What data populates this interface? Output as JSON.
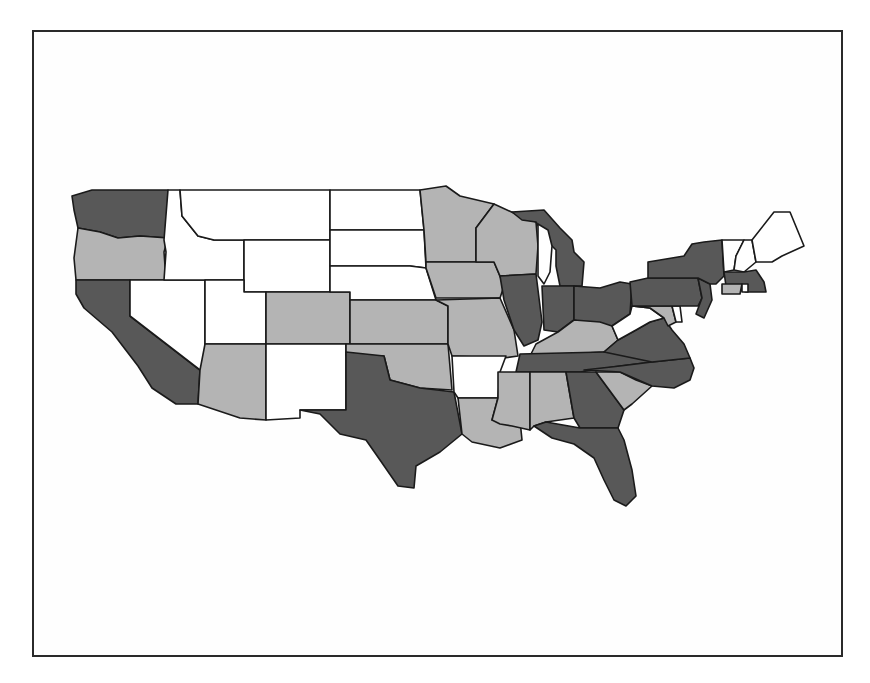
{
  "chart_data": {
    "type": "choropleth",
    "title": "",
    "region": "Contiguous United States",
    "legend": null,
    "classes": {
      "high": {
        "color": "#585858"
      },
      "mid": {
        "color": "#b4b4b4"
      },
      "low": {
        "color": "#ffffff"
      }
    },
    "states": [
      {
        "code": "WA",
        "name": "Washington",
        "class": "high",
        "points": "72,196 92,190 168,190 168,238 140,236 118,238 100,232 78,228 74,210"
      },
      {
        "code": "OR",
        "name": "Oregon",
        "class": "mid",
        "points": "78,228 100,232 118,238 140,236 168,238 164,252 166,280 76,280 74,258"
      },
      {
        "code": "CA",
        "name": "California",
        "class": "high",
        "points": "76,280 130,280 130,316 200,370 198,404 176,404 152,388 138,366 112,332 84,308 76,294"
      },
      {
        "code": "NV",
        "name": "Nevada",
        "class": "low",
        "points": "130,280 205,280 205,362 200,370 130,316"
      },
      {
        "code": "ID",
        "name": "Idaho",
        "class": "low",
        "points": "168,190 180,190 182,216 198,236 214,240 244,240 244,280 164,280 166,252 164,240"
      },
      {
        "code": "MT",
        "name": "Montana",
        "class": "low",
        "points": "180,190 330,190 330,240 244,240 214,240 198,236 182,216"
      },
      {
        "code": "WY",
        "name": "Wyoming",
        "class": "low",
        "points": "244,240 330,240 330,292 244,292"
      },
      {
        "code": "UT",
        "name": "Utah",
        "class": "low",
        "points": "205,280 244,280 244,292 266,292 266,344 205,344"
      },
      {
        "code": "AZ",
        "name": "Arizona",
        "class": "mid",
        "points": "205,344 266,344 266,420 240,418 198,404 200,370"
      },
      {
        "code": "CO",
        "name": "Colorado",
        "class": "mid",
        "points": "266,292 350,292 350,344 266,344"
      },
      {
        "code": "NM",
        "name": "New Mexico",
        "class": "low",
        "points": "266,344 346,344 346,410 300,410 300,418 266,420"
      },
      {
        "code": "ND",
        "name": "North Dakota",
        "class": "low",
        "points": "330,190 420,190 424,230 330,230"
      },
      {
        "code": "SD",
        "name": "South Dakota",
        "class": "low",
        "points": "330,230 424,230 426,268 410,266 330,266"
      },
      {
        "code": "NE",
        "name": "Nebraska",
        "class": "low",
        "points": "330,266 410,266 426,268 436,300 350,300 350,292 330,292"
      },
      {
        "code": "KS",
        "name": "Kansas",
        "class": "mid",
        "points": "350,300 436,300 448,306 448,344 350,344"
      },
      {
        "code": "OK",
        "name": "Oklahoma",
        "class": "mid",
        "points": "346,344 448,344 452,390 420,388 390,380 384,356 346,356"
      },
      {
        "code": "TX",
        "name": "Texas",
        "class": "high",
        "points": "346,352 384,356 390,380 420,388 454,392 462,434 440,452 416,466 414,488 398,486 380,460 366,440 340,434 320,414 300,410 346,410"
      },
      {
        "code": "MN",
        "name": "Minnesota",
        "class": "mid",
        "points": "420,190 446,186 460,196 494,204 476,228 476,262 426,262 424,230"
      },
      {
        "code": "IA",
        "name": "Iowa",
        "class": "mid",
        "points": "426,262 494,262 504,286 500,298 436,298 426,268"
      },
      {
        "code": "MO",
        "name": "Missouri",
        "class": "mid",
        "points": "436,300 500,298 514,330 518,356 504,358 452,356 448,344 448,306"
      },
      {
        "code": "AR",
        "name": "Arkansas",
        "class": "low",
        "points": "452,356 506,356 500,372 498,398 458,398 454,392"
      },
      {
        "code": "LA",
        "name": "Louisiana",
        "class": "mid",
        "points": "458,398 498,398 492,420 520,420 522,440 500,448 472,442 462,434"
      },
      {
        "code": "WI",
        "name": "Wisconsin",
        "class": "mid",
        "points": "476,228 494,204 516,214 536,222 538,246 536,274 500,276 494,262 476,262"
      },
      {
        "code": "IL",
        "name": "Illinois",
        "class": "high",
        "points": "500,276 536,274 542,322 538,340 524,346 514,330 504,300"
      },
      {
        "code": "MI",
        "name": "Michigan",
        "class": "high",
        "points": "512,212 544,210 560,228 572,240 574,252 584,262 582,286 560,286 556,266 556,250 548,242 536,222 522,220"
      },
      {
        "code": "IN",
        "name": "Indiana",
        "class": "high",
        "points": "542,286 574,286 574,320 558,332 544,330"
      },
      {
        "code": "OH",
        "name": "Ohio",
        "class": "high",
        "points": "574,286 600,288 620,282 632,284 630,314 612,326 590,324 574,320"
      },
      {
        "code": "KY",
        "name": "Kentucky",
        "class": "mid",
        "points": "536,344 558,332 574,320 600,322 612,326 618,340 604,352 530,356"
      },
      {
        "code": "TN",
        "name": "Tennessee",
        "class": "high",
        "points": "520,354 604,352 650,350 652,362 620,366 580,372 516,372"
      },
      {
        "code": "MS",
        "name": "Mississippi",
        "class": "mid",
        "points": "498,372 530,372 530,430 512,426 500,424 492,420 498,398"
      },
      {
        "code": "AL",
        "name": "Alabama",
        "class": "mid",
        "points": "530,372 566,372 574,418 546,422 534,426 530,430"
      },
      {
        "code": "GA",
        "name": "Georgia",
        "class": "high",
        "points": "566,372 596,372 624,410 618,428 580,428 574,418"
      },
      {
        "code": "FL",
        "name": "Florida",
        "class": "high",
        "points": "534,426 546,422 580,428 618,428 624,440 632,470 636,496 626,506 614,500 604,480 594,458 574,444 552,438"
      },
      {
        "code": "SC",
        "name": "South Carolina",
        "class": "mid",
        "points": "596,372 620,372 636,380 652,386 632,404 624,410"
      },
      {
        "code": "NC",
        "name": "North Carolina",
        "class": "high",
        "points": "584,370 620,366 652,362 690,358 694,368 690,380 674,388 652,386 620,372"
      },
      {
        "code": "VA",
        "name": "Virginia",
        "class": "high",
        "points": "604,352 618,340 636,330 650,322 664,318 672,330 684,344 690,358 652,362"
      },
      {
        "code": "WV",
        "name": "West Virginia",
        "class": "low",
        "points": "612,326 630,314 632,306 650,308 664,318 650,322 636,330 618,340"
      },
      {
        "code": "MD",
        "name": "Maryland",
        "class": "mid",
        "points": "632,306 672,306 676,322 668,326 664,318 650,308"
      },
      {
        "code": "DE",
        "name": "Delaware",
        "class": "low",
        "points": "672,306 680,306 682,322 676,322"
      },
      {
        "code": "PA",
        "name": "Pennsylvania",
        "class": "high",
        "points": "630,282 648,278 698,278 702,298 698,306 632,306"
      },
      {
        "code": "NJ",
        "name": "New Jersey",
        "class": "high",
        "points": "698,278 710,284 712,300 704,318 696,314 702,298"
      },
      {
        "code": "NY",
        "name": "New York",
        "class": "high",
        "points": "648,278 648,262 684,256 692,244 704,242 722,240 724,276 716,284 710,284 698,278"
      },
      {
        "code": "VT",
        "name": "Vermont",
        "class": "low",
        "points": "722,240 744,240 736,256 734,270 724,272"
      },
      {
        "code": "NH",
        "name": "New Hampshire",
        "class": "low",
        "points": "744,240 752,240 756,262 744,272 734,270 736,256"
      },
      {
        "code": "ME",
        "name": "Maine",
        "class": "low",
        "points": "752,240 774,212 790,212 804,246 782,256 772,262 756,262"
      },
      {
        "code": "MA",
        "name": "Massachusetts",
        "class": "high",
        "points": "724,272 744,272 756,270 764,282 766,292 746,292 726,286"
      },
      {
        "code": "CT",
        "name": "Connecticut",
        "class": "mid",
        "points": "722,284 742,284 740,294 722,294"
      },
      {
        "code": "RI",
        "name": "Rhode Island",
        "class": "low",
        "points": "742,284 748,284 748,292 742,292"
      }
    ]
  }
}
